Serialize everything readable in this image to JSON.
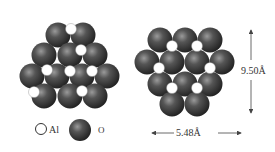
{
  "figure": {
    "legend": {
      "al_label": "Al",
      "o_label": "O"
    },
    "dimensions": {
      "width_label": "5.48Å",
      "height_label": "9.50Å"
    },
    "colors": {
      "oxygen": "#3a3a3a",
      "aluminum": "#ffffff",
      "text": "#333333"
    },
    "left_cluster": {
      "oxygen": [
        [
          58,
          35
        ],
        [
          83,
          35
        ],
        [
          44,
          55
        ],
        [
          70,
          55
        ],
        [
          95,
          55
        ],
        [
          32,
          76
        ],
        [
          57,
          76
        ],
        [
          82,
          76
        ],
        [
          107,
          76
        ],
        [
          44,
          96
        ],
        [
          70,
          96
        ],
        [
          95,
          96
        ]
      ],
      "aluminum": [
        [
          71,
          29
        ],
        [
          81,
          50
        ],
        [
          47,
          70
        ],
        [
          70,
          71
        ],
        [
          92,
          71
        ],
        [
          34,
          92
        ],
        [
          82,
          91
        ]
      ]
    },
    "right_cluster": {
      "oxygen": [
        [
          160,
          40
        ],
        [
          185,
          40
        ],
        [
          210,
          40
        ],
        [
          147,
          62
        ],
        [
          172,
          62
        ],
        [
          197,
          62
        ],
        [
          222,
          62
        ],
        [
          160,
          84
        ],
        [
          185,
          84
        ],
        [
          210,
          84
        ],
        [
          172,
          104
        ],
        [
          197,
          104
        ]
      ],
      "aluminum": [
        [
          172,
          46
        ],
        [
          197,
          46
        ],
        [
          159,
          68
        ],
        [
          210,
          68
        ],
        [
          172,
          88
        ],
        [
          197,
          88
        ]
      ]
    }
  }
}
